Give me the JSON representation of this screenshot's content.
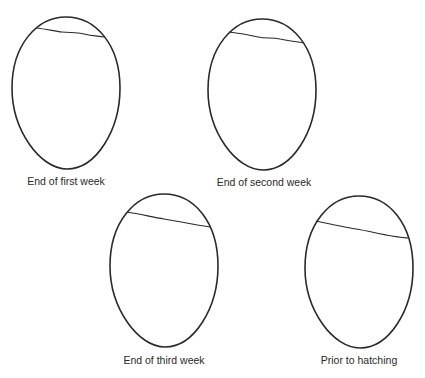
{
  "figure": {
    "eggs": [
      {
        "id": "first-week",
        "label": "End of first week"
      },
      {
        "id": "second-week",
        "label": "End of second week"
      },
      {
        "id": "third-week",
        "label": "End of third week"
      },
      {
        "id": "prior-hatching",
        "label": "Prior to hatching"
      }
    ],
    "colors": {
      "stroke": "#2a2a2a",
      "background": "#ffffff"
    }
  }
}
